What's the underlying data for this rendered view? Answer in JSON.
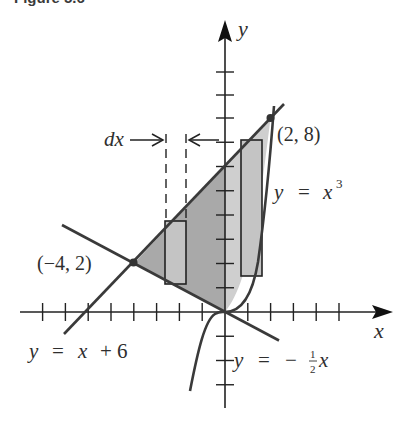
{
  "caption": "Figure 5.6",
  "axes": {
    "x_label": "x",
    "y_label": "y",
    "x_range": [
      -8,
      7
    ],
    "y_range": [
      -4,
      12
    ],
    "x_ticks": [
      -8,
      -7,
      -6,
      -5,
      -4,
      -3,
      -2,
      -1,
      1,
      2,
      3,
      4,
      5
    ],
    "y_ticks": [
      -3,
      -2,
      -1,
      1,
      2,
      3,
      4,
      5,
      6,
      7,
      8,
      9,
      10
    ]
  },
  "curves": [
    {
      "name": "line-upper",
      "equation_lhs": "y",
      "eq": "=",
      "equation_rhs": "x + 6"
    },
    {
      "name": "line-lower",
      "equation_lhs": "y",
      "eq": "=",
      "equation_rhs_sign": "−",
      "frac_num": "1",
      "frac_den": "2",
      "equation_rhs_var": "x"
    },
    {
      "name": "cubic",
      "equation_lhs": "y",
      "eq": "=",
      "equation_rhs_base": "x",
      "equation_rhs_exp": "3"
    }
  ],
  "points": [
    {
      "label": "(−4, 2)",
      "x": -4,
      "y": 2
    },
    {
      "label": "(2, 8)",
      "x": 2,
      "y": 8
    }
  ],
  "annotations": {
    "dx_label": "dx"
  },
  "colors": {
    "ink": "#2e2e2e",
    "shade_left": "#a9a9a9",
    "shade_right": "#cfcfcf",
    "rect_fill": "#c4c4c4"
  }
}
